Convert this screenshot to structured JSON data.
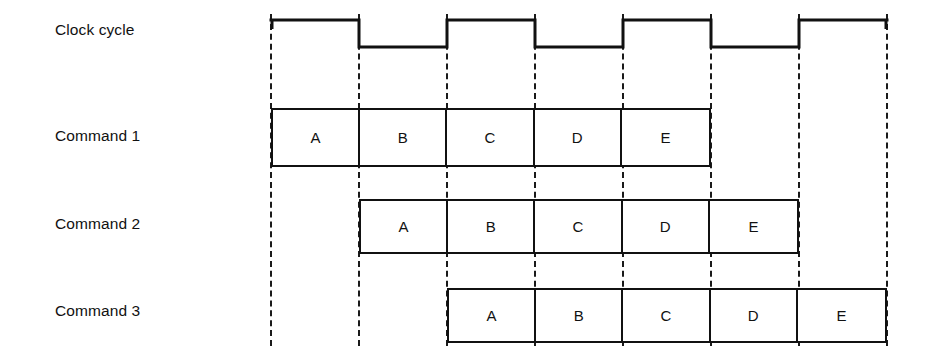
{
  "diagram": {
    "background_color": "#ffffff",
    "line_color": "#111111",
    "width": 927,
    "height": 354
  },
  "rows": {
    "clock": {
      "label": "Clock cycle"
    },
    "command1": {
      "label": "Command 1"
    },
    "command2": {
      "label": "Command 2"
    },
    "command3": {
      "label": "Command 3"
    }
  },
  "stages": [
    "A",
    "B",
    "C",
    "D",
    "E"
  ],
  "chart_data": {
    "type": "timing",
    "xlabel": "",
    "ylabel": "",
    "cycle_boundaries_px": [
      271,
      359,
      447,
      535,
      623,
      711,
      799,
      887
    ],
    "cycle_width_px": 88,
    "clock": {
      "label": "Clock cycle",
      "levels": [
        "high",
        "low",
        "high",
        "low",
        "high",
        "low",
        "high"
      ],
      "starts_high": true,
      "cycles": 7
    },
    "tracks": [
      {
        "name": "Command 1",
        "start_cycle": 0,
        "cells": [
          "A",
          "B",
          "C",
          "D",
          "E"
        ]
      },
      {
        "name": "Command 2",
        "start_cycle": 1,
        "cells": [
          "A",
          "B",
          "C",
          "D",
          "E"
        ]
      },
      {
        "name": "Command 3",
        "start_cycle": 2,
        "cells": [
          "A",
          "B",
          "C",
          "D",
          "E"
        ]
      }
    ]
  }
}
